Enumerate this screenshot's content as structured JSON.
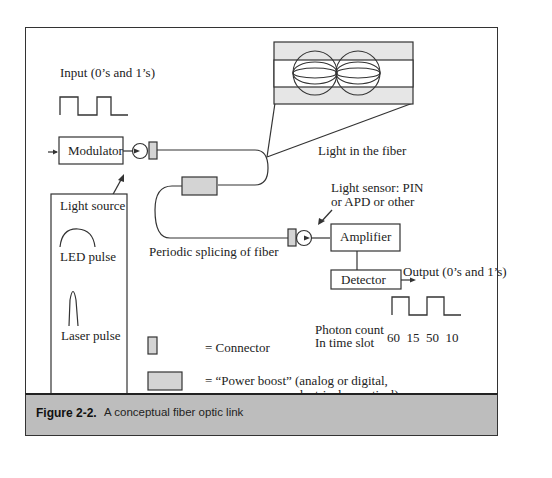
{
  "figure": {
    "number": "Figure 2-2.",
    "caption": "A conceptual fiber optic link"
  },
  "labels": {
    "input": "Input (0’s and 1’s)",
    "modulator": "Modulator",
    "light_source": "Light source",
    "led_pulse": "LED pulse",
    "laser_pulse": "Laser pulse",
    "light_in_fiber": "Light in the fiber",
    "periodic_splicing": "Periodic splicing of fiber",
    "light_sensor_line1": "Light sensor: PIN",
    "light_sensor_line2": "or APD or other",
    "amplifier": "Amplifier",
    "detector": "Detector",
    "output": "Output (0’s and 1’s)",
    "photon_count_line1": "Photon count",
    "photon_count_line2": "In time slot",
    "photon_counts": "60  15  50  10"
  },
  "legend": [
    {
      "symbol": "connector",
      "label": "= Connector"
    },
    {
      "symbol": "power-boost",
      "label_line1": "= “Power boost” (analog or digital,",
      "label_line2": "electrical or optical)"
    }
  ],
  "colors": {
    "caption_bar": "#bdbdbd",
    "component_fill": "#d4d4d4",
    "line": "#333333"
  }
}
